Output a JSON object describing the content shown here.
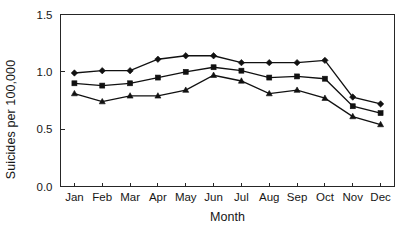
{
  "chart_data": {
    "type": "line",
    "title": "",
    "xlabel": "Month",
    "ylabel": "Suicides per 100,000",
    "categories": [
      "Jan",
      "Feb",
      "Mar",
      "Apr",
      "May",
      "Jun",
      "Jul",
      "Aug",
      "Sep",
      "Oct",
      "Nov",
      "Dec"
    ],
    "ylim": [
      0.0,
      1.5
    ],
    "yticks": [
      0.0,
      0.5,
      1.0,
      1.5
    ],
    "ytick_labels": [
      "0.0",
      "0.5",
      "1.0",
      "1.5"
    ],
    "grid": false,
    "legend": "none",
    "series": [
      {
        "name": "series-diamond",
        "marker": "diamond",
        "values": [
          0.99,
          1.01,
          1.01,
          1.11,
          1.14,
          1.14,
          1.08,
          1.08,
          1.08,
          1.1,
          0.78,
          0.72
        ]
      },
      {
        "name": "series-square",
        "marker": "square",
        "values": [
          0.9,
          0.88,
          0.9,
          0.95,
          1.0,
          1.04,
          1.01,
          0.95,
          0.96,
          0.94,
          0.7,
          0.64
        ]
      },
      {
        "name": "series-triangle",
        "marker": "triangle",
        "values": [
          0.81,
          0.74,
          0.79,
          0.79,
          0.84,
          0.97,
          0.92,
          0.81,
          0.84,
          0.77,
          0.61,
          0.54
        ]
      }
    ],
    "colors": {
      "line": "#111111",
      "marker": "#111111",
      "axis": "#262626",
      "background": "#ffffff"
    }
  }
}
